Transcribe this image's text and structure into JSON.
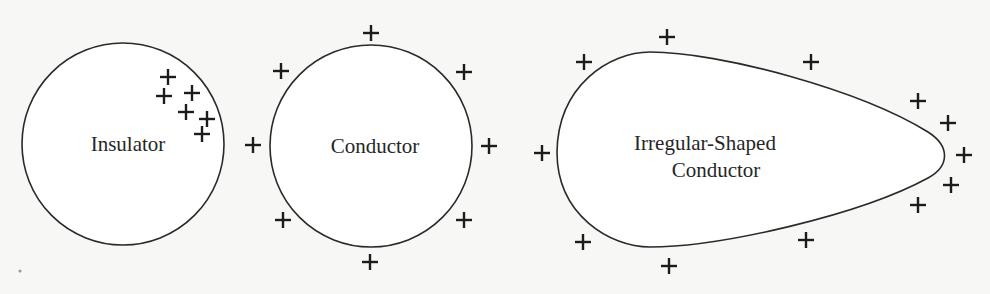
{
  "diagram": {
    "background": "#f7f7f5",
    "objects": [
      {
        "id": "insulator",
        "shape": "circle",
        "label": "Insulator",
        "center": [
          123,
          144
        ],
        "radius": 101,
        "charge_sign": "+",
        "charges": [
          [
            168,
            77
          ],
          [
            164,
            96
          ],
          [
            192,
            93
          ],
          [
            186,
            112
          ],
          [
            207,
            119
          ],
          [
            202,
            134
          ]
        ]
      },
      {
        "id": "conductor",
        "shape": "circle",
        "label": "Conductor",
        "center": [
          371,
          146
        ],
        "radius": 101,
        "charge_sign": "+",
        "charges": [
          [
            371,
            33
          ],
          [
            281,
            71
          ],
          [
            464,
            72
          ],
          [
            253,
            145
          ],
          [
            489,
            146
          ],
          [
            283,
            220
          ],
          [
            464,
            220
          ],
          [
            370,
            262
          ]
        ]
      },
      {
        "id": "irregular-conductor",
        "shape": "teardrop",
        "label_line1": "Irregular-Shaped",
        "label_line2": "Conductor",
        "charge_sign": "+",
        "charges": [
          [
            667,
            37
          ],
          [
            584,
            62
          ],
          [
            811,
            62
          ],
          [
            918,
            101
          ],
          [
            948,
            123
          ],
          [
            542,
            153
          ],
          [
            964,
            155
          ],
          [
            951,
            185
          ],
          [
            918,
            205
          ],
          [
            583,
            242
          ],
          [
            806,
            240
          ],
          [
            669,
            266
          ]
        ]
      }
    ]
  }
}
